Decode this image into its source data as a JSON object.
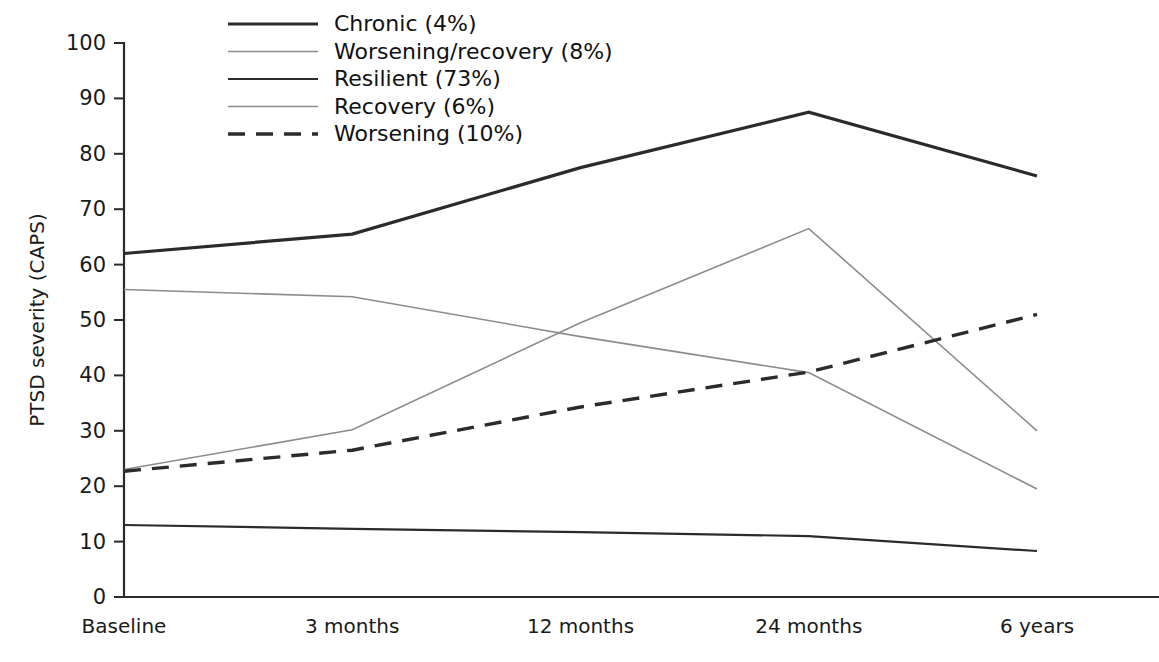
{
  "figure": {
    "background_color": "#ffffff",
    "ink_color": "#2b2b2b"
  },
  "chart_data": {
    "type": "line",
    "title": "",
    "subtitle": "",
    "xlabel": "",
    "ylabel": "PTSD severity (CAPS)",
    "categories": [
      "Baseline",
      "3 months",
      "12 months",
      "24 months",
      "6 years"
    ],
    "x": [
      0,
      1,
      2,
      3,
      4
    ],
    "ylim": [
      0,
      100
    ],
    "yticks": [
      0,
      10,
      20,
      30,
      40,
      50,
      60,
      70,
      80,
      90,
      100
    ],
    "ytick_labels": [
      "0",
      "10",
      "20",
      "30",
      "40",
      "50",
      "60",
      "70",
      "80",
      "90",
      "100"
    ],
    "grid": false,
    "legend_position": "top-center",
    "series": [
      {
        "name": "Chronic (4%)",
        "label": "Chronic (4%)",
        "percent": "4%",
        "values": [
          62,
          65.5,
          77.5,
          87.5,
          76
        ],
        "color": "#2b2b2b",
        "width": 3.2,
        "dash": "none"
      },
      {
        "name": "Worsening/recovery (8%)",
        "label": "Worsening/recovery (8%)",
        "percent": "8%",
        "values": [
          55.5,
          54.2,
          47,
          40.5,
          19.5
        ],
        "color": "#8c8c8c",
        "width": 1.6,
        "dash": "none"
      },
      {
        "name": "Resilient (73%)",
        "label": "Resilient (73%)",
        "percent": "73%",
        "values": [
          13,
          12.3,
          11.7,
          11,
          8.3
        ],
        "color": "#2b2b2b",
        "width": 2.2,
        "dash": "none"
      },
      {
        "name": "Recovery (6%)",
        "label": "Recovery (6%)",
        "percent": "6%",
        "values": [
          23,
          30.2,
          49.5,
          66.5,
          30
        ],
        "color": "#8c8c8c",
        "width": 1.6,
        "dash": "none"
      },
      {
        "name": "Worsening (10%)",
        "label": "Worsening (10%)",
        "percent": "10%",
        "values": [
          22.7,
          26.5,
          34.3,
          40.6,
          51
        ],
        "color": "#2b2b2b",
        "width": 3.4,
        "dash": "dashed"
      }
    ]
  },
  "axes": {
    "y_title": "PTSD severity (CAPS)"
  }
}
